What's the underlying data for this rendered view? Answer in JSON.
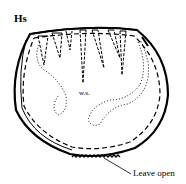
{
  "diagram": {
    "title": "Hs",
    "labels": {
      "wrong_side": "w.s.",
      "leave_open": "Leave open"
    },
    "colors": {
      "ink": "#000000",
      "background": "#ffffff"
    },
    "elements": [
      "outer-cut-edge",
      "stitching-line-dashed",
      "darts",
      "wrong-side-dotted-outline",
      "opening-zigzag",
      "leader-line"
    ]
  }
}
